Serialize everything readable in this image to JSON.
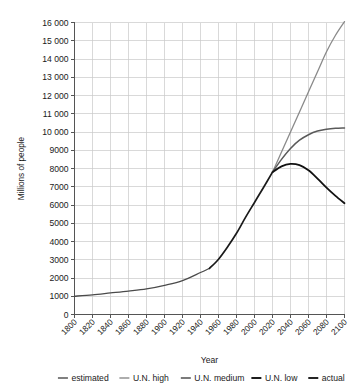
{
  "chart_data": {
    "type": "line",
    "title": "",
    "xlabel": "Year",
    "ylabel": "Millions of people",
    "xlim": [
      1800,
      2100
    ],
    "ylim": [
      0,
      16000
    ],
    "grid": true,
    "legend_position": "bottom",
    "xticks": [
      "1800",
      "1820",
      "1840",
      "1860",
      "1880",
      "1900",
      "1920",
      "1940",
      "1960",
      "1980",
      "2000",
      "2020",
      "2040",
      "2060",
      "2080",
      "2100"
    ],
    "xtick_values": [
      1800,
      1820,
      1840,
      1860,
      1880,
      1900,
      1920,
      1940,
      1960,
      1980,
      2000,
      2020,
      2040,
      2060,
      2080,
      2100
    ],
    "yticks": [
      "0",
      "1000",
      "2000",
      "3000",
      "4000",
      "5000",
      "6000",
      "7000",
      "8000",
      "9000",
      "10 000",
      "11 000",
      "12 000",
      "13 000",
      "14 000",
      "15 000",
      "16 000"
    ],
    "ytick_values": [
      0,
      1000,
      2000,
      3000,
      4000,
      5000,
      6000,
      7000,
      8000,
      9000,
      10000,
      11000,
      12000,
      13000,
      14000,
      15000,
      16000
    ],
    "series": [
      {
        "name": "estimated",
        "color": "#4a4a4a",
        "width": 1.3,
        "x": [
          1800,
          1820,
          1840,
          1860,
          1880,
          1900,
          1920,
          1940,
          1950
        ],
        "values": [
          1000,
          1080,
          1180,
          1280,
          1400,
          1600,
          1860,
          2300,
          2530
        ]
      },
      {
        "name": "actual",
        "color": "#1a1a1a",
        "width": 1.7,
        "x": [
          1950,
          1960,
          1970,
          1980,
          1990,
          2000,
          2010,
          2020
        ],
        "values": [
          2530,
          3030,
          3700,
          4450,
          5320,
          6140,
          6960,
          7800
        ]
      },
      {
        "name": "U.N. high",
        "color": "#8a8a8a",
        "width": 1.3,
        "x": [
          2020,
          2030,
          2040,
          2050,
          2060,
          2070,
          2080,
          2090,
          2100
        ],
        "values": [
          7800,
          8900,
          10000,
          11100,
          12200,
          13300,
          14400,
          15300,
          16050
        ]
      },
      {
        "name": "U.N. medium",
        "color": "#5a5a5a",
        "width": 1.5,
        "x": [
          2020,
          2030,
          2040,
          2050,
          2060,
          2070,
          2080,
          2090,
          2100
        ],
        "values": [
          7800,
          8500,
          9100,
          9550,
          9850,
          10050,
          10150,
          10200,
          10220
        ]
      },
      {
        "name": "U.N. low",
        "color": "#111111",
        "width": 1.8,
        "x": [
          2020,
          2030,
          2040,
          2050,
          2060,
          2070,
          2080,
          2090,
          2100
        ],
        "values": [
          7800,
          8120,
          8250,
          8180,
          7900,
          7450,
          6950,
          6500,
          6100
        ]
      }
    ],
    "legend": [
      {
        "label": "estimated",
        "color": "#4a4a4a",
        "width": 1.4
      },
      {
        "label": "U.N. high",
        "color": "#8a8a8a",
        "width": 1.4
      },
      {
        "label": "U.N. medium",
        "color": "#5a5a5a",
        "width": 1.6
      },
      {
        "label": "U.N. low",
        "color": "#111111",
        "width": 1.9
      },
      {
        "label": "actual",
        "color": "#1a1a1a",
        "width": 1.9
      }
    ]
  }
}
